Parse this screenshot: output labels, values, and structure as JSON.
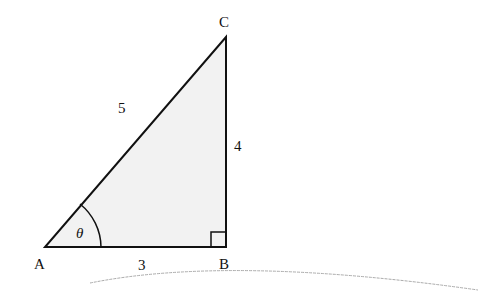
{
  "diagram": {
    "type": "right-triangle",
    "vertices": {
      "A": "A",
      "B": "B",
      "C": "C"
    },
    "sides": {
      "AC": "5",
      "BC": "4",
      "AB": "3"
    },
    "angle_label": "θ",
    "right_angle_at": "B",
    "fill_color": "#f2f2f2",
    "stroke_color": "#111111"
  }
}
